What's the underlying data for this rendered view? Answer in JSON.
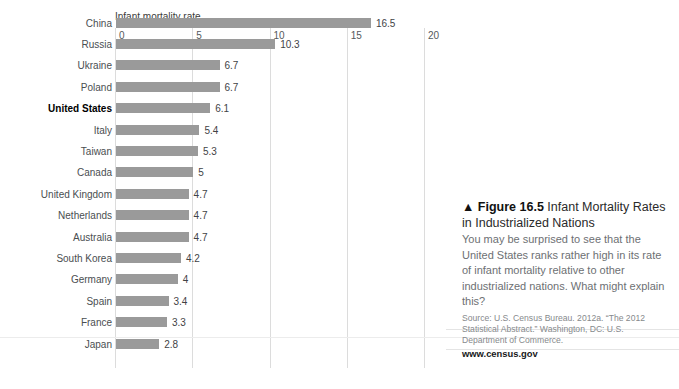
{
  "chart_data": {
    "type": "bar",
    "orientation": "horizontal",
    "title": "",
    "xlabel": "Infant mortality rate",
    "ylabel": "",
    "xlim": [
      0,
      20
    ],
    "xticks": [
      0,
      5,
      10,
      15,
      20
    ],
    "xtick_labels": [
      "0",
      "5",
      "10",
      "15",
      "20"
    ],
    "grid": true,
    "legend": false,
    "bar_color": "#9a9a9a",
    "highlight_category": "United States",
    "categories": [
      "China",
      "Russia",
      "Ukraine",
      "Poland",
      "United States",
      "Italy",
      "Taiwan",
      "Canada",
      "United Kingdom",
      "Netherlands",
      "Australia",
      "South Korea",
      "Germany",
      "Spain",
      "France",
      "Japan"
    ],
    "values": [
      16.5,
      10.3,
      6.7,
      6.7,
      6.1,
      5.4,
      5.3,
      5,
      4.7,
      4.7,
      4.7,
      4.2,
      4,
      3.4,
      3.3,
      2.8
    ],
    "value_labels": [
      "16.5",
      "10.3",
      "6.7",
      "6.7",
      "6.1",
      "5.4",
      "5.3",
      "5",
      "4.7",
      "4.7",
      "4.7",
      "4.2",
      "4",
      "3.4",
      "3.3",
      "2.8"
    ]
  },
  "caption": {
    "marker": "▲",
    "figure_number": "Figure 16.5",
    "figure_title": "Infant Mortality Rates in Industrialized Nations",
    "body": "You may be surprised to see that the United States ranks rather high in its rate of infant mortality relative to other industrialized nations. What might explain this?",
    "source": "Source: U.S. Census Bureau. 2012a. “The 2012 Statistical Abstract.” Washington, DC: U.S. Department of Commerce.",
    "url": "www.census.gov"
  }
}
